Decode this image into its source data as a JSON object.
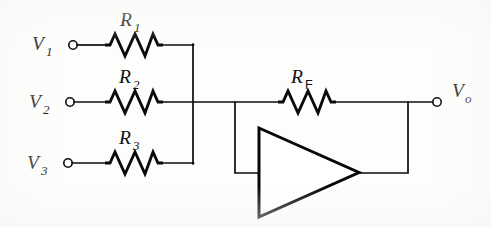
{
  "figure": {
    "background_color": "#fdfdfc",
    "line_color": "#0c0c0c"
  },
  "inputs": [
    {
      "id": "v1",
      "symbol": "V",
      "subscript": "1",
      "terminal": "open-circle",
      "resistor": {
        "symbol": "R",
        "subscript": "1"
      }
    },
    {
      "id": "v2",
      "symbol": "V",
      "subscript": "2",
      "terminal": "open-circle",
      "resistor": {
        "symbol": "R",
        "subscript": "2"
      }
    },
    {
      "id": "v3",
      "symbol": "V",
      "subscript": "3",
      "terminal": "open-circle",
      "resistor": {
        "symbol": "R",
        "subscript": "3"
      }
    }
  ],
  "feedback": {
    "id": "rf",
    "symbol": "R",
    "subscript": "F"
  },
  "output": {
    "id": "vo",
    "symbol": "V",
    "subscript": "o",
    "terminal": "open-circle"
  },
  "amplifier": {
    "id": "opamp",
    "shape": "triangle",
    "label": ""
  },
  "icons": {
    "terminal_node": "open-circle-terminal",
    "resistor": "zigzag-resistor-icon",
    "amplifier": "triangle-amplifier-icon"
  }
}
